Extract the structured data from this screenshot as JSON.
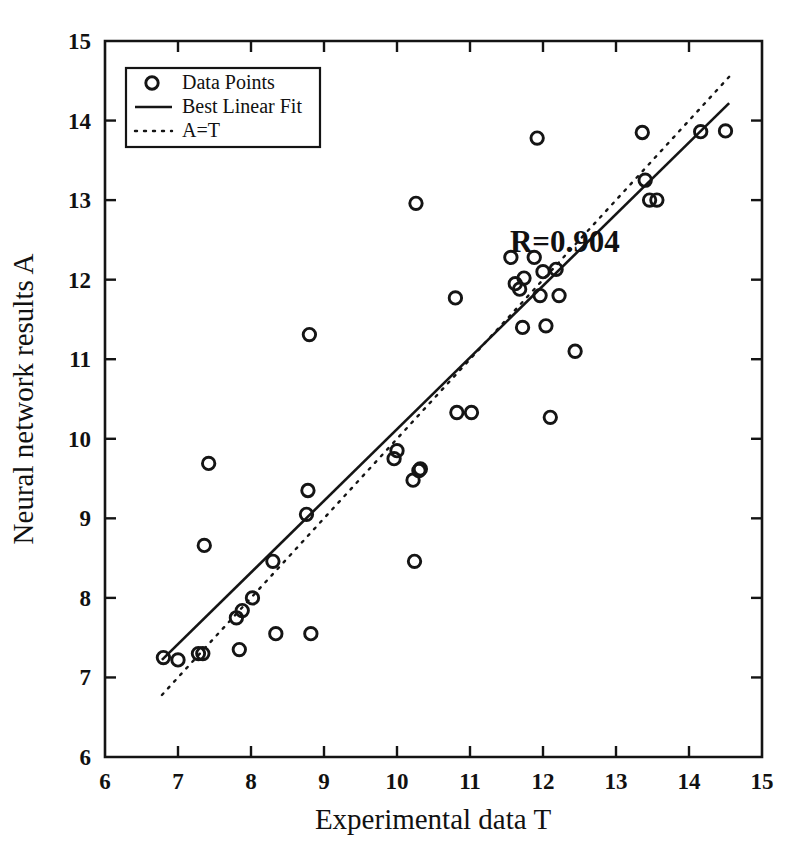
{
  "chart_data": {
    "type": "scatter",
    "title": "",
    "xlabel": "Experimental data T",
    "ylabel": "Neural network results A",
    "xlim": [
      6,
      15
    ],
    "ylim": [
      6,
      15
    ],
    "xticks": [
      6,
      7,
      8,
      9,
      10,
      11,
      12,
      13,
      14,
      15
    ],
    "yticks": [
      6,
      7,
      8,
      9,
      10,
      11,
      12,
      13,
      14,
      15
    ],
    "xticklabels": [
      "6",
      "7",
      "8",
      "9",
      "10",
      "11",
      "12",
      "13",
      "14",
      "15"
    ],
    "yticklabels": [
      "6",
      "7",
      "8",
      "9",
      "10",
      "11",
      "12",
      "13",
      "14",
      "15"
    ],
    "grid": false,
    "legend_position": "upper left",
    "annotations": [
      {
        "text": "R=0.904",
        "x": 12.3,
        "y": 12.35
      }
    ],
    "series": [
      {
        "name": "Data Points",
        "type": "scatter",
        "marker": "o",
        "x": [
          6.8,
          7.0,
          7.28,
          7.34,
          7.36,
          7.42,
          7.8,
          7.84,
          7.88,
          8.02,
          8.3,
          8.34,
          8.76,
          8.78,
          8.8,
          8.82,
          9.96,
          10.0,
          10.22,
          10.24,
          10.26,
          10.3,
          10.32,
          10.8,
          10.82,
          11.02,
          11.56,
          11.62,
          11.68,
          11.72,
          11.74,
          11.88,
          11.92,
          11.96,
          12.0,
          12.04,
          12.1,
          12.18,
          12.22,
          12.44,
          13.36,
          13.4,
          13.46,
          13.56,
          14.16,
          14.5
        ],
        "y": [
          7.25,
          7.22,
          7.3,
          7.3,
          8.66,
          9.69,
          7.75,
          7.35,
          7.84,
          8.0,
          8.46,
          7.55,
          9.05,
          9.35,
          11.31,
          7.55,
          9.75,
          9.85,
          9.48,
          8.46,
          12.96,
          9.6,
          9.62,
          11.77,
          10.33,
          10.33,
          12.28,
          11.95,
          11.88,
          11.4,
          12.02,
          12.28,
          13.78,
          11.8,
          12.1,
          11.42,
          10.27,
          12.13,
          11.8,
          11.1,
          13.85,
          13.25,
          13.0,
          13.0,
          13.86,
          13.87
        ]
      },
      {
        "name": "Best Linear Fit",
        "type": "line",
        "x": [
          6.78,
          14.55
        ],
        "y": [
          7.22,
          14.22
        ]
      },
      {
        "name": "A=T",
        "type": "line",
        "x": [
          6.78,
          14.55
        ],
        "y": [
          6.78,
          14.55
        ]
      }
    ]
  },
  "legend": {
    "items": [
      {
        "label": "Data Points",
        "marker": "circle"
      },
      {
        "label": "Best Linear Fit",
        "marker": "solid-line"
      },
      {
        "label": "A=T",
        "marker": "dotted-line"
      }
    ]
  },
  "axes": {
    "x_title": "Experimental data T",
    "y_title": "Neural network results A"
  }
}
